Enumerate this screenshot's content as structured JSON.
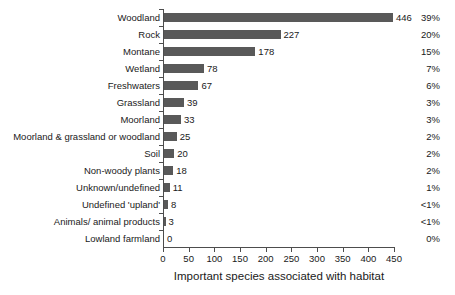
{
  "chart_data": {
    "type": "bar",
    "orientation": "horizontal",
    "title": "",
    "xlabel": "Important species associated with habitat",
    "ylabel": "",
    "xlim": [
      0,
      450
    ],
    "xticks": [
      0,
      50,
      100,
      150,
      200,
      250,
      300,
      350,
      400,
      450
    ],
    "grid": false,
    "legend": null,
    "bar_color": "#595959",
    "axis_color": "#4d4d4d",
    "categories": [
      "Woodland",
      "Rock",
      "Montane",
      "Wetland",
      "Freshwaters",
      "Grassland",
      "Moorland",
      "Moorland & grassland or woodland",
      "Soil",
      "Non-woody plants",
      "Unknown/undefined",
      "Undefined 'upland'",
      "Animals/ animal products",
      "Lowland farmland"
    ],
    "values": [
      446,
      227,
      178,
      78,
      67,
      39,
      33,
      25,
      20,
      18,
      11,
      8,
      3,
      0
    ],
    "value_labels": [
      "446",
      "227",
      "178",
      "78",
      "67",
      "39",
      "33",
      "25",
      "20",
      "18",
      "11",
      "8",
      "3",
      "0"
    ],
    "percent_labels": [
      "39%",
      "20%",
      "15%",
      "7%",
      "6%",
      "3%",
      "3%",
      "2%",
      "2%",
      "2%",
      "1%",
      "<1%",
      "<1%",
      "0%"
    ],
    "xtick_labels": [
      "0",
      "50",
      "100",
      "150",
      "200",
      "250",
      "300",
      "350",
      "400",
      "450"
    ]
  }
}
